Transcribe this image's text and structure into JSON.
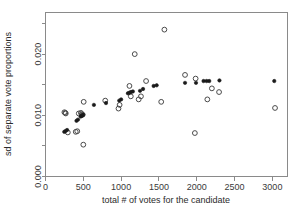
{
  "chart_data": {
    "type": "scatter",
    "title": "",
    "xlabel": "total # of votes for the candidate",
    "ylabel": "sd of separate vote proportions",
    "xlim": [
      0,
      3200
    ],
    "ylim": [
      0.0,
      0.0268
    ],
    "xticks": [
      0,
      500,
      1000,
      1500,
      2000,
      2500,
      3000
    ],
    "xticklabels": [
      "0",
      "500",
      "1000",
      "1500",
      "2000",
      "2500",
      "3000"
    ],
    "yticks": [
      0.0,
      0.005,
      0.01,
      0.015,
      0.02,
      0.025
    ],
    "yticklabels": [
      "0.000",
      "",
      "0.010",
      "",
      "0.020",
      ""
    ],
    "grid": false,
    "legend": null,
    "series": [
      {
        "name": "observed",
        "marker": "open-circle",
        "marker_color": "#4a4a4a",
        "points": [
          [
            250,
            0.0105
          ],
          [
            262,
            0.0104
          ],
          [
            268,
            0.0103
          ],
          [
            295,
            0.0072
          ],
          [
            400,
            0.0073
          ],
          [
            420,
            0.0074
          ],
          [
            440,
            0.0103
          ],
          [
            468,
            0.0104
          ],
          [
            478,
            0.0102
          ],
          [
            492,
            0.0101
          ],
          [
            505,
            0.0122
          ],
          [
            500,
            0.0052
          ],
          [
            790,
            0.0124
          ],
          [
            965,
            0.0111
          ],
          [
            980,
            0.0117
          ],
          [
            1110,
            0.0148
          ],
          [
            1128,
            0.0131
          ],
          [
            1180,
            0.02
          ],
          [
            1232,
            0.0126
          ],
          [
            1262,
            0.0131
          ],
          [
            1330,
            0.0156
          ],
          [
            1530,
            0.0122
          ],
          [
            1572,
            0.024
          ],
          [
            1845,
            0.0166
          ],
          [
            1985,
            0.016
          ],
          [
            1975,
            0.0071
          ],
          [
            2140,
            0.0126
          ],
          [
            2200,
            0.0144
          ],
          [
            2295,
            0.0138
          ],
          [
            3035,
            0.0112
          ]
        ]
      },
      {
        "name": "fitted",
        "marker": "filled-circle",
        "marker_color": "#1a1a1a",
        "points": [
          [
            248,
            0.0073
          ],
          [
            262,
            0.0074
          ],
          [
            285,
            0.0076
          ],
          [
            410,
            0.0091
          ],
          [
            430,
            0.0093
          ],
          [
            465,
            0.0098
          ],
          [
            478,
            0.0099
          ],
          [
            488,
            0.01
          ],
          [
            498,
            0.0101
          ],
          [
            640,
            0.0117
          ],
          [
            800,
            0.012
          ],
          [
            975,
            0.0124
          ],
          [
            1000,
            0.0126
          ],
          [
            1090,
            0.0136
          ],
          [
            1112,
            0.0137
          ],
          [
            1130,
            0.0138
          ],
          [
            1155,
            0.0139
          ],
          [
            1250,
            0.014
          ],
          [
            1290,
            0.0143
          ],
          [
            1430,
            0.0148
          ],
          [
            1470,
            0.0149
          ],
          [
            1845,
            0.0153
          ],
          [
            1990,
            0.0153
          ],
          [
            2090,
            0.0156
          ],
          [
            2130,
            0.0156
          ],
          [
            2165,
            0.0156
          ],
          [
            2300,
            0.0157
          ],
          [
            3025,
            0.0156
          ]
        ]
      }
    ]
  },
  "axes": {
    "x_title": "total # of votes for the candidate",
    "y_title": "sd of separate vote proportions",
    "x_tick_labels": [
      "0",
      "500",
      "1000",
      "1500",
      "2000",
      "2500",
      "3000"
    ],
    "y_tick_labels": [
      "0.000",
      "0.010",
      "0.020"
    ]
  }
}
